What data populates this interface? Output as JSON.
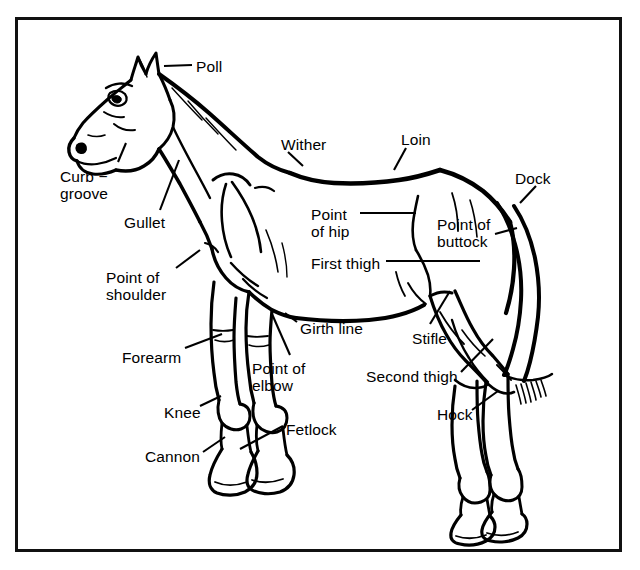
{
  "diagram": {
    "background_color": "#ffffff",
    "ink_color": "#000000",
    "frame": {
      "border_color": "#111111",
      "border_width_px": 3,
      "x": 15,
      "y": 17,
      "width": 607,
      "height": 535
    },
    "labels": [
      {
        "id": "poll",
        "text": "Poll",
        "x": 196,
        "y": 58,
        "align": "left"
      },
      {
        "id": "wither",
        "text": "Wither",
        "x": 281,
        "y": 136,
        "align": "left"
      },
      {
        "id": "loin",
        "text": "Loin",
        "x": 401,
        "y": 131,
        "align": "left"
      },
      {
        "id": "dock",
        "text": "Dock",
        "x": 515,
        "y": 170,
        "align": "left"
      },
      {
        "id": "curb-groove",
        "text": "Curb −\ngroove",
        "x": 60,
        "y": 168,
        "align": "left"
      },
      {
        "id": "gullet",
        "text": "Gullet",
        "x": 124,
        "y": 214,
        "align": "left"
      },
      {
        "id": "point-of-hip",
        "text": "Point\nof hip",
        "x": 311,
        "y": 206,
        "align": "left"
      },
      {
        "id": "point-of-buttock",
        "text": "Point of\nbuttock",
        "x": 437,
        "y": 216,
        "align": "left"
      },
      {
        "id": "first-thigh",
        "text": "First thigh",
        "x": 311,
        "y": 255,
        "align": "left"
      },
      {
        "id": "point-of-shoulder",
        "text": "Point of\nshoulder",
        "x": 106,
        "y": 269,
        "align": "left"
      },
      {
        "id": "girth-line",
        "text": "Girth line",
        "x": 300,
        "y": 320,
        "align": "left"
      },
      {
        "id": "stifle",
        "text": "Stifle",
        "x": 412,
        "y": 330,
        "align": "left"
      },
      {
        "id": "forearm",
        "text": "Forearm",
        "x": 122,
        "y": 349,
        "align": "left"
      },
      {
        "id": "point-of-elbow",
        "text": "Point of\nelbow",
        "x": 252,
        "y": 360,
        "align": "left"
      },
      {
        "id": "second-thigh",
        "text": "Second thigh",
        "x": 366,
        "y": 368,
        "align": "left"
      },
      {
        "id": "knee",
        "text": "Knee",
        "x": 164,
        "y": 404,
        "align": "left"
      },
      {
        "id": "hock",
        "text": "Hock",
        "x": 437,
        "y": 406,
        "align": "left"
      },
      {
        "id": "fetlock",
        "text": "Fetlock",
        "x": 286,
        "y": 421,
        "align": "left"
      },
      {
        "id": "cannon",
        "text": "Cannon",
        "x": 145,
        "y": 448,
        "align": "left"
      }
    ],
    "leader_lines": [
      {
        "id": "poll",
        "points": "192,65 164,66"
      },
      {
        "id": "wither",
        "points": "288,152 303,166"
      },
      {
        "id": "loin",
        "points": "406,148 394,170"
      },
      {
        "id": "dock",
        "points": "536,186 520,203"
      },
      {
        "id": "curb-groove",
        "points": "118,162 126,143"
      },
      {
        "id": "gullet",
        "points": "160,210 179,160"
      },
      {
        "id": "point-of-hip",
        "points": "360,213 416,213"
      },
      {
        "id": "point-of-buttock",
        "points": "495,234 515,228"
      },
      {
        "id": "first-thigh",
        "points": "386,261 480,261"
      },
      {
        "id": "point-of-shoulder",
        "points": "176,268 199,250"
      },
      {
        "id": "girth-line",
        "points": "297,322 285,313"
      },
      {
        "id": "stifle",
        "points": "430,324 449,292"
      },
      {
        "id": "forearm",
        "points": "185,348 222,334"
      },
      {
        "id": "point-of-elbow",
        "points": "290,355 272,314"
      },
      {
        "id": "second-thigh",
        "points": "461,372 492,340"
      },
      {
        "id": "knee",
        "points": "200,406 220,397"
      },
      {
        "id": "hock",
        "points": "472,410 497,392"
      },
      {
        "id": "fetlock",
        "points": "283,426 240,448"
      },
      {
        "id": "cannon",
        "points": "203,452 224,437"
      }
    ]
  }
}
